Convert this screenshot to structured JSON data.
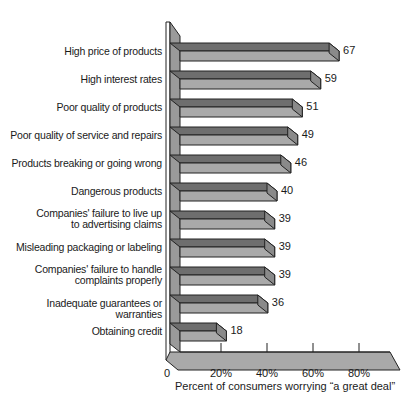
{
  "chart_data": {
    "type": "bar",
    "orientation": "horizontal",
    "style": "3d",
    "title": "",
    "xlabel": "Percent of consumers worrying “a great deal”",
    "ylabel": "",
    "xlim": [
      0,
      90
    ],
    "xticks": [
      "0",
      "20%",
      "40%",
      "60%",
      "80%"
    ],
    "xtick_values": [
      0,
      20,
      40,
      60,
      80
    ],
    "grid": false,
    "legend": null,
    "categories": [
      "High price of products",
      "High interest rates",
      "Poor quality of products",
      "Poor quality of service and repairs",
      "Products breaking or going wrong",
      "Dangerous products",
      "Companies' failure to live up\nto advertising claims",
      "Misleading packaging or labeling",
      "Companies' failure to handle\ncomplaints properly",
      "Inadequate guarantees or warranties",
      "Obtaining credit"
    ],
    "values": [
      67,
      59,
      51,
      49,
      46,
      40,
      39,
      39,
      39,
      36,
      18
    ],
    "value_labels": [
      "67",
      "59",
      "51",
      "49",
      "46",
      "40",
      "39",
      "39",
      "39",
      "36",
      "18"
    ],
    "colors": {
      "bar_top": "#6e6e6e",
      "bar_front": "#a9a9a9",
      "bar_end": "#8a8a8a",
      "wall": "#9a9a9a",
      "floor": "#a9a9a9",
      "outline": "#222222"
    }
  }
}
